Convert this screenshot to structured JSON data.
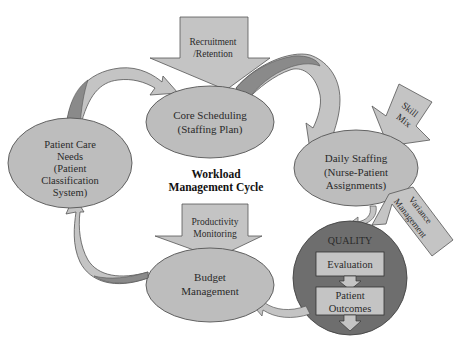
{
  "diagram": {
    "title_line1": "Workload",
    "title_line2": "Management Cycle",
    "nodes": {
      "core_scheduling": {
        "line1": "Core Scheduling",
        "line2": "(Staffing Plan)"
      },
      "daily_staffing": {
        "line1": "Daily Staffing",
        "line2": "(Nurse-Patient",
        "line3": "Assignments)"
      },
      "patient_care_needs": {
        "line1": "Patient Care",
        "line2": "Needs",
        "line3": "(Patient",
        "line4": "Classification",
        "line5": "System)"
      },
      "budget_management": {
        "line1": "Budget",
        "line2": "Management"
      },
      "quality": {
        "label": "QUALITY",
        "step1": "Evaluation",
        "step2_line1": "Patient",
        "step2_line2": "Outcomes"
      }
    },
    "inputs": {
      "recruitment": {
        "line1": "Recruitment",
        "line2": "/Retention"
      },
      "skill_mix": {
        "line1": "Skill",
        "line2": "Mix"
      },
      "variance": {
        "line1": "Variance",
        "line2": "Management"
      },
      "productivity": {
        "line1": "Productivity",
        "line2": "Monitoring"
      }
    },
    "colors": {
      "node_fill": "#bdbdbd",
      "quality_fill": "#6e6e6e",
      "arrow_fill": "#c4c4c4",
      "arrow_shade": "#8a8a8a",
      "stroke": "#555555"
    }
  }
}
